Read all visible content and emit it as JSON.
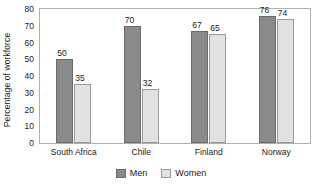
{
  "chart_data": {
    "type": "bar",
    "title": "",
    "subtitle": "",
    "xlabel": "",
    "ylabel": "Percentage of workforce",
    "categories": [
      "South Africa",
      "Chile",
      "Finland",
      "Norway"
    ],
    "series": [
      {
        "name": "Men",
        "color": "#8a8a8a",
        "values": [
          50,
          70,
          67,
          76
        ]
      },
      {
        "name": "Women",
        "color": "#e2e2e2",
        "values": [
          35,
          32,
          65,
          74
        ]
      }
    ],
    "ylim": [
      0,
      80
    ],
    "yticks": [
      0,
      10,
      20,
      30,
      40,
      50,
      60,
      70,
      80
    ],
    "ytick_labels": [
      "0",
      "10",
      "20",
      "30",
      "40",
      "50",
      "60",
      "70",
      "80"
    ],
    "grid": false,
    "legend_position": "bottom",
    "data_labels": true,
    "frame": true
  },
  "legend": {
    "entries": [
      {
        "label": "Men",
        "swatch": "men-swatch"
      },
      {
        "label": "Women",
        "swatch": "women-swatch"
      }
    ]
  }
}
